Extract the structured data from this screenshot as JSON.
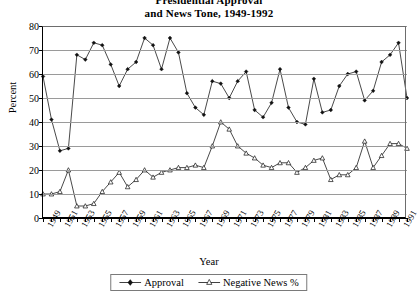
{
  "chart_data": {
    "type": "line",
    "title": "Presidential Approval\nand News Tone, 1949-1992",
    "xlabel": "Year",
    "ylabel": "Percent",
    "ylim": [
      0,
      80
    ],
    "ytick_step": 10,
    "yticks": [
      "0",
      "10",
      "20",
      "30",
      "40",
      "50",
      "60",
      "70",
      "80"
    ],
    "xlim": [
      1949,
      1992
    ],
    "grid": true,
    "legend_position": "bottom",
    "x": [
      1949,
      1950,
      1951,
      1952,
      1953,
      1954,
      1955,
      1956,
      1957,
      1958,
      1959,
      1960,
      1961,
      1962,
      1963,
      1964,
      1965,
      1966,
      1967,
      1968,
      1969,
      1970,
      1971,
      1972,
      1973,
      1974,
      1975,
      1976,
      1977,
      1978,
      1979,
      1980,
      1981,
      1982,
      1983,
      1984,
      1985,
      1986,
      1987,
      1988,
      1989,
      1990,
      1991,
      1992
    ],
    "xtick_labels": [
      "1949",
      "1951",
      "1953",
      "1955",
      "1957",
      "1959",
      "1961",
      "1963",
      "1965",
      "1967",
      "1969",
      "1971",
      "1973",
      "1975",
      "1977",
      "1979",
      "1981",
      "1983",
      "1985",
      "1987",
      "1989",
      "1991"
    ],
    "series": [
      {
        "name": "Approval",
        "marker": "filled-diamond",
        "values": [
          59,
          41,
          28,
          29,
          68,
          66,
          73,
          72,
          64,
          55,
          62,
          65,
          75,
          72,
          62,
          75,
          69,
          52,
          46,
          43,
          57,
          56,
          50,
          57,
          61,
          45,
          42,
          48,
          62,
          46,
          40,
          39,
          58,
          44,
          45,
          55,
          60,
          61,
          49,
          53,
          65,
          68,
          73,
          50
        ]
      },
      {
        "name": "Negative News %",
        "marker": "open-triangle",
        "values": [
          10,
          10,
          11,
          20,
          5,
          5,
          6,
          11,
          15,
          19,
          13,
          16,
          20,
          17,
          19,
          20,
          21,
          21,
          22,
          21,
          30,
          40,
          37,
          30,
          27,
          25,
          22,
          21,
          23,
          23,
          19,
          21,
          24,
          25,
          16,
          18,
          18,
          21,
          32,
          21,
          26,
          31,
          31,
          29
        ]
      }
    ],
    "legend": [
      {
        "label": "Approval",
        "marker": "filled-diamond"
      },
      {
        "label": "Negative News %",
        "marker": "open-triangle"
      }
    ]
  }
}
